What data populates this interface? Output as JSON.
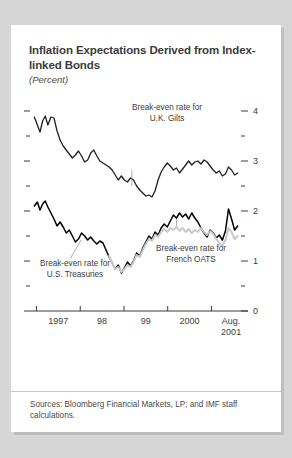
{
  "card": {
    "title": "Inflation Expectations Derived from Index-linked Bonds",
    "subtitle": "(Percent)",
    "source_note": "Sources: Bloomberg Financial Markets, LP; and IMF staff calculations."
  },
  "annotations": {
    "uk": "Break-even rate for\nU.K. Gilts",
    "us": "Break-even rate for\nU.S. Treasuries",
    "fr": "Break-even rate for\nFrench OATS"
  },
  "colors": {
    "background": "#d6d6d6",
    "card": "#ffffff",
    "uk_line": "#231f20",
    "us_line": "#000000",
    "fr_line": "#c8c8c8",
    "axis": "#3b3b3b",
    "text": "#3b3b3b"
  },
  "chart_data": {
    "type": "line",
    "title": "Inflation Expectations Derived from Index-linked Bonds",
    "subtitle": "(Percent)",
    "xlabel": "",
    "ylabel": "Percent",
    "ylim": [
      0,
      4.2
    ],
    "yticks": [
      0,
      1,
      2,
      3,
      4
    ],
    "ytick_labels": [
      "0",
      "1",
      "2",
      "3",
      "4"
    ],
    "yticks_minor": [
      0.5,
      1.5,
      2.5,
      3.5
    ],
    "ytick_side": "right",
    "grid": false,
    "legend": "inline-annotations",
    "xlim": [
      1996.92,
      2001.63
    ],
    "xticks": [
      1997.0,
      1998.0,
      1999.0,
      2000.0,
      2001.0
    ],
    "xtick_labels": [
      "1997",
      "98",
      "99",
      "2000",
      "Aug.\n2001"
    ],
    "xtick_label_positions": [
      1997.5,
      1998.5,
      1999.5,
      2000.5,
      2001.45
    ],
    "series": [
      {
        "name": "Break-even rate for U.K. Gilts",
        "color": "#231f20",
        "width": 1.3,
        "x": [
          1996.95,
          1997.02,
          1997.08,
          1997.14,
          1997.2,
          1997.26,
          1997.33,
          1997.4,
          1997.47,
          1997.54,
          1997.61,
          1997.68,
          1997.75,
          1997.82,
          1997.89,
          1997.96,
          1998.03,
          1998.1,
          1998.17,
          1998.24,
          1998.31,
          1998.38,
          1998.45,
          1998.52,
          1998.59,
          1998.66,
          1998.73,
          1998.8,
          1998.87,
          1998.94,
          1999.01,
          1999.08,
          1999.15,
          1999.22,
          1999.29,
          1999.36,
          1999.43,
          1999.5,
          1999.57,
          1999.64,
          1999.71,
          1999.78,
          1999.85,
          1999.92,
          1999.99,
          2000.06,
          2000.13,
          2000.2,
          2000.27,
          2000.34,
          2000.41,
          2000.48,
          2000.55,
          2000.62,
          2000.69,
          2000.76,
          2000.83,
          2000.9,
          2000.97,
          2001.04,
          2001.11,
          2001.18,
          2001.25,
          2001.32,
          2001.39,
          2001.46,
          2001.53,
          2001.6
        ],
        "y": [
          3.88,
          3.72,
          3.58,
          3.8,
          3.9,
          3.72,
          3.88,
          3.86,
          3.6,
          3.42,
          3.3,
          3.22,
          3.14,
          3.06,
          3.12,
          3.2,
          3.1,
          2.98,
          3.02,
          3.16,
          3.22,
          3.1,
          3.0,
          2.96,
          2.92,
          2.88,
          2.82,
          2.72,
          2.62,
          2.7,
          2.62,
          2.58,
          2.66,
          2.62,
          2.5,
          2.42,
          2.36,
          2.3,
          2.32,
          2.28,
          2.4,
          2.62,
          2.78,
          2.88,
          2.96,
          2.9,
          2.82,
          2.86,
          2.76,
          2.84,
          2.92,
          3.0,
          2.92,
          2.98,
          3.0,
          2.94,
          3.02,
          2.98,
          2.9,
          2.82,
          2.76,
          2.8,
          2.7,
          2.74,
          2.88,
          2.82,
          2.72,
          2.76
        ]
      },
      {
        "name": "Break-even rate for U.S. Treasuries",
        "color": "#000000",
        "width": 1.5,
        "x": [
          1996.95,
          1997.02,
          1997.08,
          1997.14,
          1997.2,
          1997.26,
          1997.33,
          1997.4,
          1997.47,
          1997.54,
          1997.61,
          1997.68,
          1997.75,
          1997.82,
          1997.89,
          1997.96,
          1998.03,
          1998.1,
          1998.17,
          1998.24,
          1998.31,
          1998.38,
          1998.45,
          1998.52,
          1998.59,
          1998.66,
          1998.73,
          1998.8,
          1998.87,
          1998.94,
          1999.01,
          1999.08,
          1999.15,
          1999.22,
          1999.29,
          1999.36,
          1999.43,
          1999.5,
          1999.57,
          1999.64,
          1999.71,
          1999.78,
          1999.85,
          1999.92,
          1999.99,
          2000.06,
          2000.13,
          2000.2,
          2000.27,
          2000.34,
          2000.41,
          2000.48,
          2000.55,
          2000.62,
          2000.69,
          2000.76,
          2000.83,
          2000.9,
          2000.97,
          2001.04,
          2001.11,
          2001.18,
          2001.25,
          2001.32,
          2001.39,
          2001.46,
          2001.53,
          2001.6
        ],
        "y": [
          2.1,
          2.18,
          2.02,
          2.14,
          2.2,
          2.08,
          1.96,
          1.84,
          1.7,
          1.78,
          1.68,
          1.56,
          1.62,
          1.5,
          1.38,
          1.44,
          1.56,
          1.5,
          1.42,
          1.48,
          1.4,
          1.34,
          1.4,
          1.36,
          1.22,
          1.08,
          0.96,
          0.84,
          0.92,
          0.76,
          0.86,
          0.98,
          0.9,
          1.0,
          1.16,
          1.1,
          1.26,
          1.38,
          1.5,
          1.44,
          1.58,
          1.52,
          1.66,
          1.74,
          1.68,
          1.8,
          1.92,
          1.86,
          1.96,
          1.88,
          1.94,
          1.84,
          1.96,
          1.86,
          1.78,
          1.66,
          1.56,
          1.48,
          1.62,
          1.56,
          1.46,
          1.52,
          1.42,
          1.6,
          2.04,
          1.84,
          1.62,
          1.7
        ]
      },
      {
        "name": "Break-even rate for French OATS",
        "color": "#c8c8c8",
        "width": 2.0,
        "x": [
          1998.66,
          1998.73,
          1998.8,
          1998.87,
          1998.94,
          1999.01,
          1999.08,
          1999.15,
          1999.22,
          1999.29,
          1999.36,
          1999.43,
          1999.5,
          1999.57,
          1999.64,
          1999.71,
          1999.78,
          1999.85,
          1999.92,
          1999.99,
          2000.06,
          2000.13,
          2000.2,
          2000.27,
          2000.34,
          2000.41,
          2000.48,
          2000.55,
          2000.62,
          2000.69,
          2000.76,
          2000.83,
          2000.9,
          2000.97,
          2001.04,
          2001.11,
          2001.18,
          2001.25,
          2001.32,
          2001.39,
          2001.46,
          2001.53,
          2001.6
        ],
        "y": [
          1.1,
          0.96,
          0.84,
          0.88,
          0.78,
          0.84,
          0.92,
          0.88,
          0.98,
          1.12,
          1.08,
          1.22,
          1.34,
          1.44,
          1.4,
          1.52,
          1.48,
          1.58,
          1.64,
          1.58,
          1.66,
          1.62,
          1.68,
          1.6,
          1.66,
          1.58,
          1.64,
          1.56,
          1.62,
          1.58,
          1.66,
          1.58,
          1.52,
          1.6,
          1.54,
          1.44,
          1.36,
          1.3,
          1.42,
          1.66,
          1.58,
          1.44,
          1.5
        ]
      }
    ]
  }
}
